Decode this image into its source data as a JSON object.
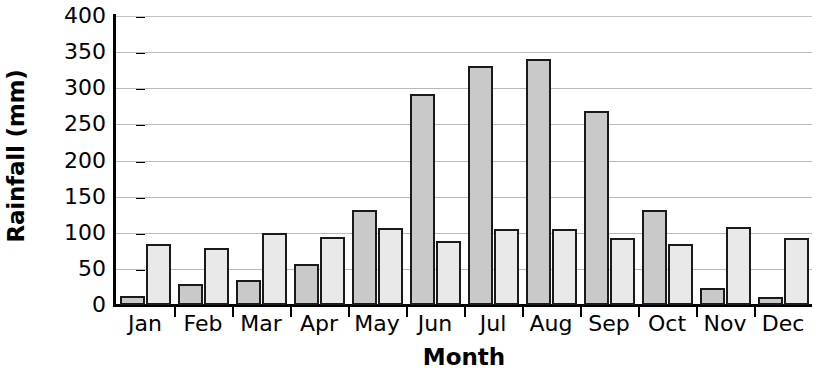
{
  "chart_data": {
    "type": "bar",
    "title": "",
    "xlabel": "Month",
    "ylabel": "Rainfall (mm)",
    "categories": [
      "Jan",
      "Feb",
      "Mar",
      "Apr",
      "May",
      "Jun",
      "Jul",
      "Aug",
      "Sep",
      "Oct",
      "Nov",
      "Dec"
    ],
    "ylim": [
      0,
      400
    ],
    "yticks": [
      0,
      50,
      100,
      150,
      200,
      250,
      300,
      350,
      400
    ],
    "ytick_labels": [
      "0",
      "50",
      "100",
      "150",
      "200",
      "250",
      "300",
      "350",
      "400"
    ],
    "grid": true,
    "legend": "none",
    "series": [
      {
        "name": "Series 1",
        "color": "#c9c9c9",
        "values": [
          13,
          29,
          35,
          57,
          131,
          292,
          331,
          340,
          268,
          132,
          23,
          11
        ]
      },
      {
        "name": "Series 2",
        "color": "#e9e9e9",
        "values": [
          85,
          79,
          100,
          94,
          106,
          88,
          105,
          105,
          93,
          84,
          108,
          93
        ]
      }
    ]
  },
  "axis": {
    "y_title": "Rainfall (mm)",
    "x_title": "Month"
  }
}
